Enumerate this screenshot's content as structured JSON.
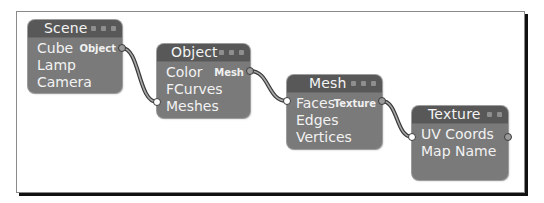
{
  "diagram": {
    "type": "node-graph",
    "colors": {
      "node_body": "#7a7a7a",
      "node_header": "#585858",
      "text": "#f2f2f2",
      "wire_outline": "#3a3a3a",
      "wire_inner": "#a8a8a8",
      "socket_output": "#9a9a9a",
      "socket_input": "#ffffff"
    },
    "nodes": [
      {
        "id": "scene",
        "title": "Scene",
        "header_icons": 3,
        "items": [
          "Cube",
          "Lamp",
          "Camera"
        ],
        "output_label": "Object",
        "output_row": 0
      },
      {
        "id": "object",
        "title": "Object",
        "header_icons": 3,
        "items": [
          "Color",
          "FCurves",
          "Meshes"
        ],
        "output_label": "Mesh",
        "output_row": 0,
        "input_row": 2
      },
      {
        "id": "mesh",
        "title": "Mesh",
        "header_icons": 3,
        "items": [
          "Faces",
          "Edges",
          "Vertices"
        ],
        "output_label": "Texture",
        "output_row": 0,
        "input_row": 0
      },
      {
        "id": "texture",
        "title": "Texture",
        "header_icons": 2,
        "items": [
          "UV Coords",
          "Map Name"
        ],
        "output_label": "",
        "output_row": 0,
        "input_row": 0
      }
    ],
    "edges": [
      {
        "from": "Scene.Object",
        "to": "Object.Meshes"
      },
      {
        "from": "Object.Mesh",
        "to": "Mesh.Faces"
      },
      {
        "from": "Mesh.Texture",
        "to": "Texture.UV Coords"
      }
    ]
  }
}
